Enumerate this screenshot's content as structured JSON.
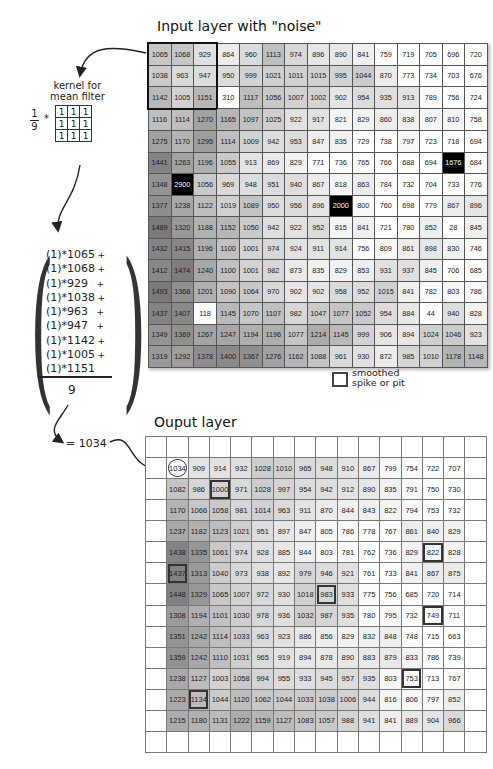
{
  "input_layer": {
    "title": "Input layer with  \"noise\"",
    "rows": [
      [
        1065,
        1068,
        929,
        864,
        960,
        1113,
        974,
        896,
        890,
        841,
        759,
        719,
        705,
        696,
        720,
        708
      ],
      [
        1038,
        963,
        947,
        950,
        999,
        1021,
        1011,
        1015,
        995,
        1044,
        870,
        773,
        734,
        703,
        676,
        684
      ],
      [
        1142,
        1005,
        1151,
        310,
        1117,
        1056,
        1007,
        1002,
        902,
        954,
        935,
        913,
        789,
        756,
        724,
        700
      ],
      [
        1116,
        1114,
        1270,
        1165,
        1097,
        1025,
        922,
        917,
        821,
        829,
        860,
        838,
        807,
        810,
        758,
        760
      ],
      [
        1275,
        1170,
        1295,
        1114,
        1009,
        942,
        953,
        847,
        835,
        729,
        738,
        797,
        723,
        718,
        694,
        670
      ],
      [
        1441,
        1263,
        1196,
        1055,
        913,
        869,
        829,
        771,
        736,
        765,
        766,
        688,
        694,
        1676,
        684,
        698
      ],
      [
        1348,
        2900,
        1056,
        969,
        948,
        951,
        940,
        867,
        818,
        863,
        784,
        732,
        704,
        733,
        776,
        804
      ],
      [
        1377,
        1238,
        1122,
        1019,
        1089,
        950,
        956,
        896,
        2000,
        800,
        760,
        698,
        779,
        867,
        896,
        744
      ],
      [
        1489,
        1320,
        1188,
        1152,
        1050,
        942,
        922,
        952,
        815,
        841,
        721,
        780,
        852,
        28,
        845,
        738
      ],
      [
        1432,
        1415,
        1196,
        1100,
        1001,
        974,
        924,
        911,
        914,
        756,
        809,
        861,
        898,
        830,
        746,
        710
      ],
      [
        1412,
        1474,
        1240,
        1100,
        1001,
        982,
        873,
        835,
        829,
        853,
        931,
        937,
        845,
        706,
        685,
        680
      ],
      [
        1493,
        1368,
        1201,
        1090,
        1064,
        970,
        902,
        902,
        958,
        952,
        1015,
        841,
        782,
        803,
        786,
        711
      ],
      [
        1437,
        1407,
        118,
        1145,
        1070,
        1107,
        982,
        1047,
        1077,
        1052,
        954,
        884,
        44,
        940,
        828,
        771
      ],
      [
        1349,
        1369,
        1267,
        1247,
        1194,
        1196,
        1077,
        1214,
        1145,
        999,
        906,
        894,
        1024,
        1046,
        923,
        862
      ],
      [
        1319,
        1292,
        1378,
        1400,
        1367,
        1276,
        1162,
        1088,
        961,
        930,
        872,
        985,
        1010,
        1178,
        1148,
        1000
      ]
    ],
    "kernel_window_highlight": "rows 1-3, cols 1-3"
  },
  "kernel": {
    "label_line1": "kernel for",
    "label_line2": "mean filter",
    "fraction_numerator": "1",
    "fraction_denominator": "9",
    "operator": "*",
    "values": [
      [
        1,
        1,
        1
      ],
      [
        1,
        1,
        1
      ],
      [
        1,
        1,
        1
      ]
    ]
  },
  "formula": {
    "terms": [
      "(1)*1065",
      "(1)*1068",
      "(1)*929",
      "(1)*1038",
      "(1)*963",
      "(1)*947",
      "(1)*1142",
      "(1)*1005",
      "(1)*1151"
    ],
    "plus": "+",
    "denominator": "9",
    "result": "= 1034"
  },
  "legend": {
    "line1": "smoothed",
    "line2": "spike or pit"
  },
  "output_layer": {
    "title": "Ouput layer",
    "rows": [
      [
        1034,
        909,
        914,
        932,
        1028,
        1010,
        965,
        948,
        910,
        867,
        799,
        754,
        722,
        707
      ],
      [
        1082,
        986,
        1000,
        971,
        1028,
        997,
        954,
        942,
        912,
        890,
        835,
        791,
        750,
        730
      ],
      [
        1170,
        1066,
        1058,
        981,
        1014,
        963,
        911,
        870,
        844,
        843,
        822,
        794,
        753,
        732
      ],
      [
        1237,
        1182,
        1123,
        1021,
        951,
        897,
        847,
        805,
        786,
        778,
        767,
        861,
        840,
        829
      ],
      [
        1438,
        1335,
        1061,
        974,
        928,
        885,
        844,
        803,
        781,
        762,
        736,
        829,
        822,
        828
      ],
      [
        1437,
        1313,
        1040,
        973,
        938,
        892,
        979,
        946,
        921,
        761,
        733,
        841,
        867,
        875
      ],
      [
        1448,
        1329,
        1065,
        1007,
        972,
        930,
        1018,
        983,
        933,
        775,
        756,
        685,
        720,
        714
      ],
      [
        1308,
        1194,
        1101,
        1030,
        978,
        936,
        1032,
        987,
        935,
        780,
        795,
        732,
        749,
        711
      ],
      [
        1351,
        1242,
        1114,
        1033,
        963,
        923,
        886,
        856,
        829,
        832,
        848,
        748,
        715,
        663
      ],
      [
        1359,
        1242,
        1110,
        1031,
        965,
        919,
        894,
        878,
        890,
        883,
        879,
        833,
        786,
        739
      ],
      [
        1238,
        1127,
        1003,
        1058,
        994,
        955,
        933,
        945,
        957,
        935,
        803,
        753,
        713,
        767
      ],
      [
        1223,
        1134,
        1044,
        1120,
        1062,
        1044,
        1033,
        1038,
        1006,
        944,
        816,
        806,
        797,
        852
      ],
      [
        1215,
        1180,
        1131,
        1222,
        1159,
        1127,
        1083,
        1057,
        988,
        941,
        841,
        889,
        904,
        966
      ]
    ],
    "highlighted_cells": [
      [
        1,
        2
      ],
      [
        4,
        12
      ],
      [
        5,
        0
      ],
      [
        6,
        7
      ],
      [
        7,
        12
      ],
      [
        10,
        11
      ],
      [
        11,
        1
      ]
    ],
    "circled_cell": [
      0,
      0
    ]
  },
  "colors": {
    "min_value_color": "#ffffff",
    "max_value_color": "#707070",
    "spike_color": "#000000",
    "grid_line": "#555555"
  }
}
